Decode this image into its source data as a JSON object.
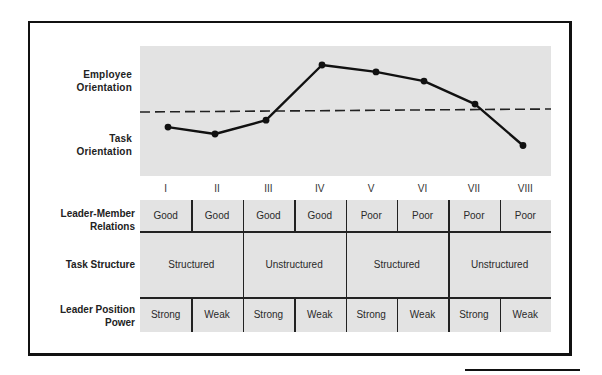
{
  "chart_data": {
    "type": "line",
    "title": "",
    "categories": [
      "I",
      "II",
      "III",
      "IV",
      "V",
      "VI",
      "VII",
      "VIII"
    ],
    "series": [
      {
        "name": "Leader orientation (relative to midpoint, + = employee, - = task)",
        "values": [
          -0.35,
          -0.5,
          -0.2,
          1.0,
          0.85,
          0.65,
          0.15,
          -0.75
        ]
      }
    ],
    "reference_line": {
      "style": "dashed",
      "value": 0
    },
    "ylabel_top": "Employee Orientation",
    "ylabel_bottom": "Task Orientation",
    "ylim": [
      -1.4,
      1.4
    ],
    "grid": false,
    "legend": "none"
  },
  "y_axis": {
    "top_label": [
      "Employee",
      "Orientation"
    ],
    "bottom_label": [
      "Task",
      "Orientation"
    ]
  },
  "octants": [
    "I",
    "II",
    "III",
    "IV",
    "V",
    "VI",
    "VII",
    "VIII"
  ],
  "table": {
    "rows": [
      {
        "label": [
          "Leader-Member",
          "Relations"
        ],
        "cells": [
          {
            "text": "Good",
            "span": 1
          },
          {
            "text": "Good",
            "span": 1
          },
          {
            "text": "Good",
            "span": 1
          },
          {
            "text": "Good",
            "span": 1
          },
          {
            "text": "Poor",
            "span": 1
          },
          {
            "text": "Poor",
            "span": 1
          },
          {
            "text": "Poor",
            "span": 1
          },
          {
            "text": "Poor",
            "span": 1
          }
        ]
      },
      {
        "label": [
          "Task Structure"
        ],
        "cells": [
          {
            "text": "Structured",
            "span": 2
          },
          {
            "text": "Unstructured",
            "span": 2
          },
          {
            "text": "Structured",
            "span": 2
          },
          {
            "text": "Unstructured",
            "span": 2
          }
        ]
      },
      {
        "label": [
          "Leader Position",
          "Power"
        ],
        "cells": [
          {
            "text": "Strong",
            "span": 1
          },
          {
            "text": "Weak",
            "span": 1
          },
          {
            "text": "Strong",
            "span": 1
          },
          {
            "text": "Weak",
            "span": 1
          },
          {
            "text": "Strong",
            "span": 1
          },
          {
            "text": "Weak",
            "span": 1
          },
          {
            "text": "Strong",
            "span": 1
          },
          {
            "text": "Weak",
            "span": 1
          }
        ]
      }
    ]
  },
  "colors": {
    "panel": "#e3e3e3",
    "ink": "#111111"
  }
}
